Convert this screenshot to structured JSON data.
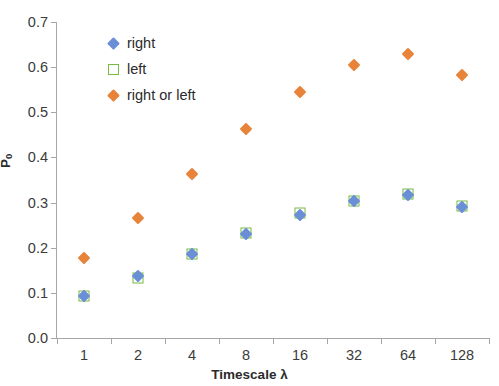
{
  "chart_data": {
    "type": "scatter",
    "title": "",
    "xlabel": "Timescale λ",
    "ylabel": "P0",
    "ylabel_display": "P",
    "ylabel_sub": "0",
    "categories": [
      "1",
      "2",
      "4",
      "8",
      "16",
      "32",
      "64",
      "128"
    ],
    "ylim": [
      0.0,
      0.7
    ],
    "yticks": [
      "0.0",
      "0.1",
      "0.2",
      "0.3",
      "0.4",
      "0.5",
      "0.6",
      "0.7"
    ],
    "ytick_values": [
      0.0,
      0.1,
      0.2,
      0.3,
      0.4,
      0.5,
      0.6,
      0.7
    ],
    "grid": false,
    "legend_position": "upper-left-inside",
    "series": [
      {
        "name": "right",
        "marker": "diamond",
        "color": "#6a8fd6",
        "values": [
          0.093,
          0.137,
          0.185,
          0.231,
          0.273,
          0.303,
          0.317,
          0.291
        ]
      },
      {
        "name": "left",
        "marker": "open-square",
        "color": "#77bb41",
        "values": [
          0.093,
          0.134,
          0.186,
          0.233,
          0.276,
          0.304,
          0.318,
          0.293
        ]
      },
      {
        "name": "right or left",
        "marker": "diamond",
        "color": "#e8833a",
        "values": [
          0.178,
          0.265,
          0.364,
          0.463,
          0.545,
          0.605,
          0.629,
          0.582
        ]
      }
    ]
  },
  "axis": {
    "x_title": "Timescale λ",
    "y_title_main": "P",
    "y_title_sub": "0"
  },
  "legend": {
    "items": [
      {
        "label": "right",
        "color": "#6a8fd6",
        "marker": "diamond"
      },
      {
        "label": "left",
        "color": "#77bb41",
        "marker": "open-square"
      },
      {
        "label": "right or left",
        "color": "#e8833a",
        "marker": "diamond"
      }
    ]
  },
  "colors": {
    "right": "#6a8fd6",
    "left": "#77bb41",
    "right_or_left": "#e8833a",
    "axis": "#a6a6a6",
    "text": "#2b2b2b",
    "background": "#ffffff"
  }
}
